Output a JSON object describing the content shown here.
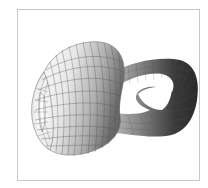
{
  "figure": {
    "frame_color": "#c8c8c8",
    "background": "#ffffff",
    "colors": {
      "light_surface": "#f2f2f2",
      "mid_surface": "#9a9a9a",
      "dark_surface": "#2e2e2e",
      "mesh_line": "#555555"
    }
  }
}
